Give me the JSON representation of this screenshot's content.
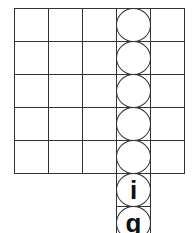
{
  "grid": {
    "origin_x": 14,
    "origin_y": 8,
    "cell_w": 34,
    "cell_h": 33,
    "cols": 5,
    "rows": 5,
    "line_color": "#333333",
    "circle_column_index": 3
  },
  "circles": [
    {
      "row": 0,
      "letter": ""
    },
    {
      "row": 1,
      "letter": ""
    },
    {
      "row": 2,
      "letter": ""
    },
    {
      "row": 3,
      "letter": ""
    },
    {
      "row": 4,
      "letter": ""
    },
    {
      "row": 5,
      "letter": "i"
    },
    {
      "row": 6,
      "letter": "g"
    }
  ]
}
